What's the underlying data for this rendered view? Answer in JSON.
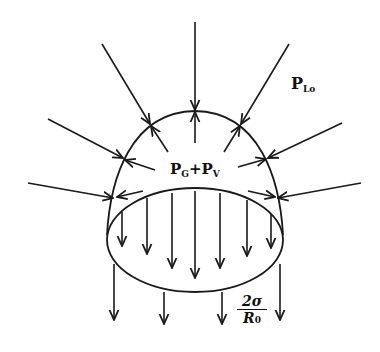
{
  "diagram": {
    "type": "bubble pressure balance",
    "labels": {
      "outer_pressure": {
        "main": "P",
        "sub": "Lo"
      },
      "inner_pressure": {
        "main1": "P",
        "sub1": "G",
        "plus": "+",
        "main2": "P",
        "sub2": "V"
      },
      "surface_tension": {
        "numerator": "2σ",
        "denominator_main": "R",
        "denominator_sub": "0"
      }
    },
    "shapes": {
      "dome": "hemispherical cap over elliptical base",
      "arrows_inward_count": 7,
      "arrows_outward_count": 7,
      "arrows_down_inside_base": 7,
      "arrows_down_below_base": 4
    },
    "colors": {
      "stroke": "#1a1a1a",
      "background": "#ffffff"
    }
  }
}
